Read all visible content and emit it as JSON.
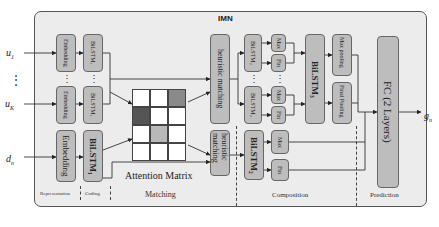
{
  "title": "IMN",
  "inputs": {
    "u1": {
      "base": "u",
      "sub": "1"
    },
    "uK": {
      "base": "u",
      "sub": "K"
    },
    "dn": {
      "base": "d",
      "sub": "n"
    },
    "ellipsis": "⋮"
  },
  "output": {
    "base": "g",
    "sub": "n"
  },
  "blocks": {
    "embedding_small": "Embedding",
    "bilstm1_small": "BiLSTM₁",
    "embedding_large": "Embedding",
    "bilstm1_large": "BiLSTM₁",
    "heuristic_top": "heuristic matching",
    "heuristic_bottom": "heuristic matching",
    "bilstm2_top": "BiLSTM₂",
    "bilstm2_bottom": "BiLSTM₂",
    "bilstm2_doc": "BiLSTM₂",
    "max": "Max",
    "fin": "Fin",
    "bilstm3": "BiLSTM₃",
    "max_pooling": "Max pooling",
    "final_pooling": "Final Pooling",
    "fc": "FC (2 Layers)"
  },
  "attention_matrix": {
    "label": "Attention Matrix",
    "rows": 4,
    "cols": 3,
    "cells": [
      [
        "#ffffff",
        "#ffffff",
        "#8a8a8a"
      ],
      [
        "#555555",
        "#ffffff",
        "#ffffff"
      ],
      [
        "#ffffff",
        "#b8b8b8",
        "#ffffff"
      ],
      [
        "#ffffff",
        "#ffffff",
        "#ffffff"
      ]
    ]
  },
  "sections": {
    "representation": "Representation",
    "coding": "Coding",
    "matching": "Matching",
    "composition": "Composition",
    "prediction": "Prediction"
  },
  "colors": {
    "frame_bg": "#ececec",
    "block_bg": "#bdbdbd",
    "border": "#555555"
  }
}
